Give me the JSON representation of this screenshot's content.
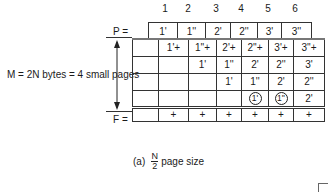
{
  "diagram": {
    "column_numbers": [
      "1",
      "2",
      "3",
      "4",
      "5",
      "6"
    ],
    "p_label": "P =",
    "p_row": [
      "1'",
      "1''",
      "2'",
      "2''",
      "3'",
      "3''"
    ],
    "memory_label": "M = 2N bytes = 4 small pages",
    "grid_rows": [
      [
        "",
        "1'+",
        "1''+",
        "2'+",
        "2''+",
        "3'+",
        "3''+"
      ],
      [
        "",
        "",
        "1'",
        "1''",
        "2'",
        "2''",
        "3'"
      ],
      [
        "",
        "",
        "",
        "1'",
        "1''",
        "2'",
        "2''"
      ],
      [
        "",
        "",
        "",
        "",
        "1'",
        "1''",
        "2'"
      ]
    ],
    "circled_cells": [
      [
        3,
        4
      ],
      [
        3,
        5
      ]
    ],
    "f_label": "F =",
    "f_row": [
      "",
      "+",
      "+",
      "+",
      "+",
      "+",
      "+"
    ],
    "caption": {
      "prefix": "(a)",
      "fraction_numerator": "N",
      "fraction_denominator": "2",
      "suffix": "page size"
    }
  }
}
